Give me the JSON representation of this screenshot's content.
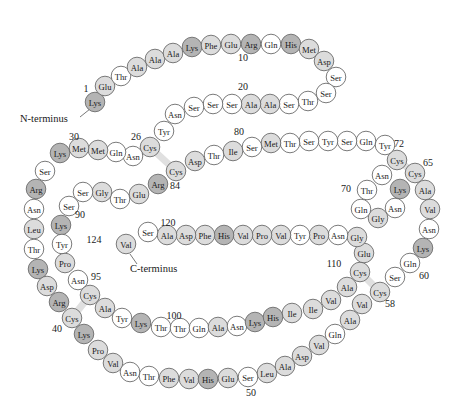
{
  "diagram": {
    "title": "",
    "colors": {
      "white": "#ffffff",
      "light": "#dcdcdc",
      "dark": "#b4b4b4",
      "disulfide": "#e0e0e0",
      "stroke": "#6b6b6b"
    },
    "termini": {
      "n_label": "N-terminus",
      "c_label": "C-terminus"
    },
    "numbers": [
      {
        "text": "1",
        "x": 86,
        "y": 92
      },
      {
        "text": "10",
        "x": 243,
        "y": 61
      },
      {
        "text": "20",
        "x": 243,
        "y": 90
      },
      {
        "text": "26",
        "x": 136,
        "y": 140
      },
      {
        "text": "30",
        "x": 74,
        "y": 140
      },
      {
        "text": "80",
        "x": 239,
        "y": 135
      },
      {
        "text": "72",
        "x": 399,
        "y": 147
      },
      {
        "text": "65",
        "x": 428,
        "y": 166
      },
      {
        "text": "70",
        "x": 346,
        "y": 192
      },
      {
        "text": "84",
        "x": 175,
        "y": 189
      },
      {
        "text": "90",
        "x": 80,
        "y": 218
      },
      {
        "text": "120",
        "x": 168,
        "y": 226
      },
      {
        "text": "124",
        "x": 94,
        "y": 243
      },
      {
        "text": "95",
        "x": 96,
        "y": 280
      },
      {
        "text": "110",
        "x": 334,
        "y": 267
      },
      {
        "text": "60",
        "x": 424,
        "y": 279
      },
      {
        "text": "58",
        "x": 390,
        "y": 307
      },
      {
        "text": "40",
        "x": 57,
        "y": 332
      },
      {
        "text": "100",
        "x": 174,
        "y": 319
      },
      {
        "text": "50",
        "x": 251,
        "y": 396
      }
    ],
    "residues": [
      {
        "n": 1,
        "aa": "Lys",
        "x": 95,
        "y": 102,
        "shade": "dark"
      },
      {
        "n": 2,
        "aa": "Glu",
        "x": 105,
        "y": 86,
        "shade": "light"
      },
      {
        "n": 3,
        "aa": "Thr",
        "x": 121,
        "y": 76,
        "shade": "white"
      },
      {
        "n": 4,
        "aa": "Ala",
        "x": 137,
        "y": 67,
        "shade": "light"
      },
      {
        "n": 5,
        "aa": "Ala",
        "x": 155,
        "y": 59,
        "shade": "light"
      },
      {
        "n": 6,
        "aa": "Ala",
        "x": 173,
        "y": 53,
        "shade": "light"
      },
      {
        "n": 7,
        "aa": "Lys",
        "x": 192,
        "y": 47,
        "shade": "dark"
      },
      {
        "n": 8,
        "aa": "Phe",
        "x": 211,
        "y": 45,
        "shade": "light"
      },
      {
        "n": 9,
        "aa": "Glu",
        "x": 231,
        "y": 44,
        "shade": "light"
      },
      {
        "n": 10,
        "aa": "Arg",
        "x": 251,
        "y": 44,
        "shade": "dark"
      },
      {
        "n": 11,
        "aa": "Gln",
        "x": 271,
        "y": 44,
        "shade": "white"
      },
      {
        "n": 12,
        "aa": "His",
        "x": 291,
        "y": 44,
        "shade": "dark"
      },
      {
        "n": 13,
        "aa": "Met",
        "x": 309,
        "y": 49,
        "shade": "light"
      },
      {
        "n": 14,
        "aa": "Asp",
        "x": 324,
        "y": 61,
        "shade": "light"
      },
      {
        "n": 15,
        "aa": "Ser",
        "x": 336,
        "y": 77,
        "shade": "white"
      },
      {
        "n": 16,
        "aa": "Ser",
        "x": 326,
        "y": 93,
        "shade": "white"
      },
      {
        "n": 17,
        "aa": "Thr",
        "x": 308,
        "y": 101,
        "shade": "white"
      },
      {
        "n": 18,
        "aa": "Ser",
        "x": 289,
        "y": 104,
        "shade": "white"
      },
      {
        "n": 19,
        "aa": "Ala",
        "x": 270,
        "y": 104,
        "shade": "light"
      },
      {
        "n": 20,
        "aa": "Ala",
        "x": 251,
        "y": 104,
        "shade": "light"
      },
      {
        "n": 21,
        "aa": "Ser",
        "x": 232,
        "y": 104,
        "shade": "white"
      },
      {
        "n": 22,
        "aa": "Ser",
        "x": 213,
        "y": 104,
        "shade": "white"
      },
      {
        "n": 23,
        "aa": "Ser",
        "x": 194,
        "y": 107,
        "shade": "white"
      },
      {
        "n": 24,
        "aa": "Asn",
        "x": 175,
        "y": 114,
        "shade": "white"
      },
      {
        "n": 25,
        "aa": "Tyr",
        "x": 164,
        "y": 131,
        "shade": "white"
      },
      {
        "n": 26,
        "aa": "Cys",
        "x": 150,
        "y": 147,
        "shade": "light"
      },
      {
        "n": 27,
        "aa": "Asn",
        "x": 133,
        "y": 156,
        "shade": "white"
      },
      {
        "n": 28,
        "aa": "Gln",
        "x": 116,
        "y": 152,
        "shade": "white"
      },
      {
        "n": 29,
        "aa": "Met",
        "x": 98,
        "y": 150,
        "shade": "light"
      },
      {
        "n": 30,
        "aa": "Met",
        "x": 79,
        "y": 148,
        "shade": "light"
      },
      {
        "n": 31,
        "aa": "Lys",
        "x": 60,
        "y": 153,
        "shade": "dark"
      },
      {
        "n": 32,
        "aa": "Ser",
        "x": 45,
        "y": 171,
        "shade": "white"
      },
      {
        "n": 33,
        "aa": "Arg",
        "x": 36,
        "y": 189,
        "shade": "dark"
      },
      {
        "n": 34,
        "aa": "Asn",
        "x": 34,
        "y": 209,
        "shade": "white"
      },
      {
        "n": 35,
        "aa": "Leu",
        "x": 34,
        "y": 229,
        "shade": "light"
      },
      {
        "n": 36,
        "aa": "Thr",
        "x": 34,
        "y": 249,
        "shade": "white"
      },
      {
        "n": 37,
        "aa": "Lys",
        "x": 38,
        "y": 269,
        "shade": "dark"
      },
      {
        "n": 38,
        "aa": "Asp",
        "x": 47,
        "y": 286,
        "shade": "light"
      },
      {
        "n": 39,
        "aa": "Arg",
        "x": 59,
        "y": 302,
        "shade": "dark"
      },
      {
        "n": 40,
        "aa": "Cys",
        "x": 72,
        "y": 318,
        "shade": "light"
      },
      {
        "n": 41,
        "aa": "Lys",
        "x": 84,
        "y": 334,
        "shade": "dark"
      },
      {
        "n": 42,
        "aa": "Pro",
        "x": 98,
        "y": 350,
        "shade": "light"
      },
      {
        "n": 43,
        "aa": "Val",
        "x": 113,
        "y": 363,
        "shade": "light"
      },
      {
        "n": 44,
        "aa": "Asn",
        "x": 130,
        "y": 372,
        "shade": "white"
      },
      {
        "n": 45,
        "aa": "Thr",
        "x": 149,
        "y": 376,
        "shade": "white"
      },
      {
        "n": 46,
        "aa": "Phe",
        "x": 169,
        "y": 378,
        "shade": "light"
      },
      {
        "n": 47,
        "aa": "Val",
        "x": 189,
        "y": 379,
        "shade": "light"
      },
      {
        "n": 48,
        "aa": "His",
        "x": 208,
        "y": 379,
        "shade": "dark"
      },
      {
        "n": 49,
        "aa": "Glu",
        "x": 228,
        "y": 378,
        "shade": "light"
      },
      {
        "n": 50,
        "aa": "Ser",
        "x": 248,
        "y": 377,
        "shade": "white"
      },
      {
        "n": 51,
        "aa": "Leu",
        "x": 267,
        "y": 373,
        "shade": "light"
      },
      {
        "n": 52,
        "aa": "Ala",
        "x": 285,
        "y": 366,
        "shade": "light"
      },
      {
        "n": 53,
        "aa": "Asp",
        "x": 302,
        "y": 356,
        "shade": "light"
      },
      {
        "n": 54,
        "aa": "Val",
        "x": 319,
        "y": 345,
        "shade": "light"
      },
      {
        "n": 55,
        "aa": "Gln",
        "x": 335,
        "y": 334,
        "shade": "white"
      },
      {
        "n": 56,
        "aa": "Ala",
        "x": 350,
        "y": 320,
        "shade": "light"
      },
      {
        "n": 57,
        "aa": "Val",
        "x": 362,
        "y": 304,
        "shade": "light"
      },
      {
        "n": 58,
        "aa": "Cys",
        "x": 380,
        "y": 292,
        "shade": "light"
      },
      {
        "n": 59,
        "aa": "Ser",
        "x": 395,
        "y": 277,
        "shade": "white"
      },
      {
        "n": 60,
        "aa": "Gln",
        "x": 410,
        "y": 263,
        "shade": "white"
      },
      {
        "n": 61,
        "aa": "Lys",
        "x": 423,
        "y": 248,
        "shade": "dark"
      },
      {
        "n": 62,
        "aa": "Asn",
        "x": 429,
        "y": 229,
        "shade": "white"
      },
      {
        "n": 63,
        "aa": "Val",
        "x": 430,
        "y": 209,
        "shade": "light"
      },
      {
        "n": 64,
        "aa": "Ala",
        "x": 425,
        "y": 190,
        "shade": "light"
      },
      {
        "n": 65,
        "aa": "Cys",
        "x": 415,
        "y": 173,
        "shade": "light"
      },
      {
        "n": 66,
        "aa": "Lys",
        "x": 400,
        "y": 189,
        "shade": "dark"
      },
      {
        "n": 67,
        "aa": "Asn",
        "x": 395,
        "y": 208,
        "shade": "white"
      },
      {
        "n": 68,
        "aa": "Gly",
        "x": 378,
        "y": 218,
        "shade": "light"
      },
      {
        "n": 69,
        "aa": "Gln",
        "x": 361,
        "y": 209,
        "shade": "white"
      },
      {
        "n": 70,
        "aa": "Thr",
        "x": 367,
        "y": 190,
        "shade": "white"
      },
      {
        "n": 71,
        "aa": "Asn",
        "x": 382,
        "y": 175,
        "shade": "white"
      },
      {
        "n": 72,
        "aa": "Cys",
        "x": 397,
        "y": 160,
        "shade": "light"
      },
      {
        "n": 73,
        "aa": "Tyr",
        "x": 385,
        "y": 145,
        "shade": "white"
      },
      {
        "n": 74,
        "aa": "Gln",
        "x": 366,
        "y": 141,
        "shade": "white"
      },
      {
        "n": 75,
        "aa": "Ser",
        "x": 347,
        "y": 141,
        "shade": "white"
      },
      {
        "n": 76,
        "aa": "Tyr",
        "x": 328,
        "y": 141,
        "shade": "white"
      },
      {
        "n": 77,
        "aa": "Ser",
        "x": 309,
        "y": 141,
        "shade": "white"
      },
      {
        "n": 78,
        "aa": "Thr",
        "x": 290,
        "y": 143,
        "shade": "white"
      },
      {
        "n": 79,
        "aa": "Met",
        "x": 271,
        "y": 143,
        "shade": "light"
      },
      {
        "n": 80,
        "aa": "Ser",
        "x": 252,
        "y": 147,
        "shade": "white"
      },
      {
        "n": 81,
        "aa": "Ile",
        "x": 233,
        "y": 151,
        "shade": "light"
      },
      {
        "n": 82,
        "aa": "Thr",
        "x": 214,
        "y": 155,
        "shade": "white"
      },
      {
        "n": 83,
        "aa": "Asp",
        "x": 195,
        "y": 161,
        "shade": "light"
      },
      {
        "n": 84,
        "aa": "Cys",
        "x": 176,
        "y": 171,
        "shade": "light"
      },
      {
        "n": 85,
        "aa": "Arg",
        "x": 158,
        "y": 184,
        "shade": "dark"
      },
      {
        "n": 86,
        "aa": "Glu",
        "x": 139,
        "y": 194,
        "shade": "light"
      },
      {
        "n": 87,
        "aa": "Thr",
        "x": 120,
        "y": 199,
        "shade": "white"
      },
      {
        "n": 88,
        "aa": "Gly",
        "x": 102,
        "y": 192,
        "shade": "light"
      },
      {
        "n": 89,
        "aa": "Ser",
        "x": 83,
        "y": 192,
        "shade": "white"
      },
      {
        "n": 90,
        "aa": "Ser",
        "x": 69,
        "y": 206,
        "shade": "white"
      },
      {
        "n": 91,
        "aa": "Lys",
        "x": 61,
        "y": 225,
        "shade": "dark"
      },
      {
        "n": 92,
        "aa": "Tyr",
        "x": 62,
        "y": 244,
        "shade": "white"
      },
      {
        "n": 93,
        "aa": "Pro",
        "x": 65,
        "y": 263,
        "shade": "light"
      },
      {
        "n": 94,
        "aa": "Asn",
        "x": 78,
        "y": 280,
        "shade": "white"
      },
      {
        "n": 95,
        "aa": "Cys",
        "x": 90,
        "y": 295,
        "shade": "light"
      },
      {
        "n": 96,
        "aa": "Ala",
        "x": 105,
        "y": 308,
        "shade": "light"
      },
      {
        "n": 97,
        "aa": "Tyr",
        "x": 122,
        "y": 318,
        "shade": "white"
      },
      {
        "n": 98,
        "aa": "Lys",
        "x": 141,
        "y": 323,
        "shade": "dark"
      },
      {
        "n": 99,
        "aa": "Thr",
        "x": 161,
        "y": 327,
        "shade": "white"
      },
      {
        "n": 100,
        "aa": "Thr",
        "x": 180,
        "y": 328,
        "shade": "white"
      },
      {
        "n": 101,
        "aa": "Gln",
        "x": 199,
        "y": 328,
        "shade": "white"
      },
      {
        "n": 102,
        "aa": "Ala",
        "x": 218,
        "y": 327,
        "shade": "light"
      },
      {
        "n": 103,
        "aa": "Asn",
        "x": 237,
        "y": 326,
        "shade": "white"
      },
      {
        "n": 104,
        "aa": "Lys",
        "x": 255,
        "y": 322,
        "shade": "dark"
      },
      {
        "n": 105,
        "aa": "His",
        "x": 273,
        "y": 317,
        "shade": "dark"
      },
      {
        "n": 106,
        "aa": "Ile",
        "x": 292,
        "y": 313,
        "shade": "light"
      },
      {
        "n": 107,
        "aa": "Ile",
        "x": 313,
        "y": 309,
        "shade": "light"
      },
      {
        "n": 108,
        "aa": "Val",
        "x": 331,
        "y": 300,
        "shade": "light"
      },
      {
        "n": 109,
        "aa": "Ala",
        "x": 347,
        "y": 287,
        "shade": "light"
      },
      {
        "n": 110,
        "aa": "Cys",
        "x": 360,
        "y": 272,
        "shade": "light"
      },
      {
        "n": 111,
        "aa": "Glu",
        "x": 364,
        "y": 253,
        "shade": "light"
      },
      {
        "n": 112,
        "aa": "Gly",
        "x": 357,
        "y": 237,
        "shade": "light"
      },
      {
        "n": 113,
        "aa": "Asn",
        "x": 338,
        "y": 235,
        "shade": "white"
      },
      {
        "n": 114,
        "aa": "Pro",
        "x": 319,
        "y": 235,
        "shade": "light"
      },
      {
        "n": 115,
        "aa": "Tyr",
        "x": 300,
        "y": 235,
        "shade": "white"
      },
      {
        "n": 116,
        "aa": "Val",
        "x": 281,
        "y": 235,
        "shade": "light"
      },
      {
        "n": 117,
        "aa": "Pro",
        "x": 262,
        "y": 235,
        "shade": "light"
      },
      {
        "n": 118,
        "aa": "Val",
        "x": 243,
        "y": 235,
        "shade": "light"
      },
      {
        "n": 119,
        "aa": "His",
        "x": 224,
        "y": 235,
        "shade": "dark"
      },
      {
        "n": 120,
        "aa": "Phe",
        "x": 205,
        "y": 235,
        "shade": "light"
      },
      {
        "n": 121,
        "aa": "Asp",
        "x": 186,
        "y": 235,
        "shade": "light"
      },
      {
        "n": 122,
        "aa": "Ala",
        "x": 167,
        "y": 235,
        "shade": "light"
      },
      {
        "n": 123,
        "aa": "Ser",
        "x": 148,
        "y": 232,
        "shade": "white"
      },
      {
        "n": 124,
        "aa": "Val",
        "x": 126,
        "y": 244,
        "shade": "light"
      }
    ],
    "disulfides": [
      {
        "from": 26,
        "to": 84
      },
      {
        "from": 40,
        "to": 95
      },
      {
        "from": 58,
        "to": 110
      },
      {
        "from": 65,
        "to": 72
      }
    ]
  }
}
